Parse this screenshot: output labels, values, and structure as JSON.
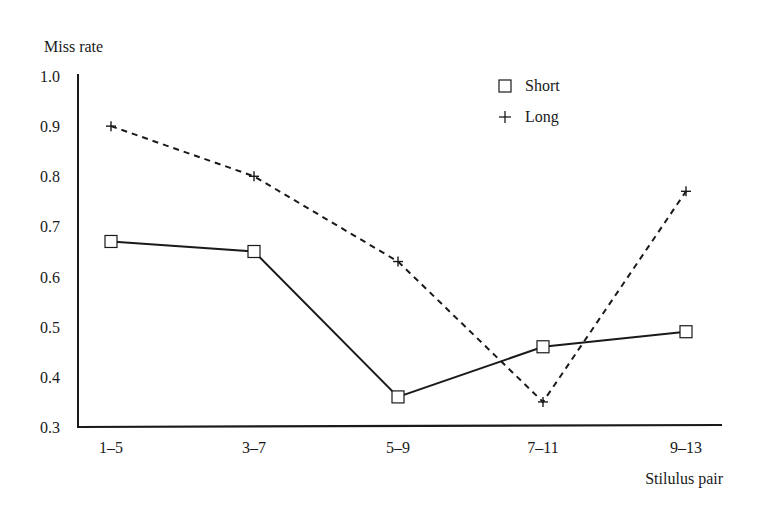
{
  "chart_data": {
    "type": "line",
    "title": "",
    "ylabel": "Miss rate",
    "xlabel": "Stilulus pair",
    "categories": [
      "1–5",
      "3–7",
      "5–9",
      "7–11",
      "9–13"
    ],
    "ylim": [
      0.3,
      1.0
    ],
    "yticks": [
      "0.3",
      "0.4",
      "0.5",
      "0.6",
      "0.7",
      "0.8",
      "0.9",
      "1.0"
    ],
    "grid": false,
    "legend_position": "upper-right",
    "series": [
      {
        "name": "Short",
        "marker": "square",
        "line_style": "solid",
        "values": [
          0.67,
          0.65,
          0.36,
          0.46,
          0.49
        ]
      },
      {
        "name": "Long",
        "marker": "plus",
        "line_style": "dashed",
        "values": [
          0.9,
          0.8,
          0.63,
          0.35,
          0.77
        ]
      }
    ]
  },
  "legend": {
    "items": [
      {
        "label": "Short",
        "marker": "square-icon"
      },
      {
        "label": "Long",
        "marker": "plus-icon"
      }
    ]
  },
  "colors": {
    "ink": "#1a1a1a",
    "background": "#ffffff"
  }
}
